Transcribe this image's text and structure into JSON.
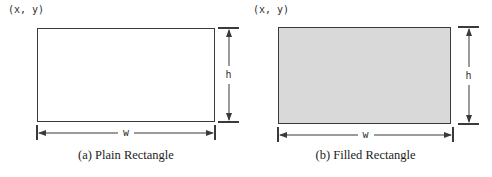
{
  "figures": [
    {
      "corner_label": "(x, y)",
      "height_label": "h",
      "width_label": "w",
      "caption": "(a) Plain Rectangle",
      "style": "plain",
      "fill_color": "#ffffff"
    },
    {
      "corner_label": "(x, y)",
      "height_label": "h",
      "width_label": "w",
      "caption": "(b) Filled Rectangle",
      "style": "filled",
      "fill_color": "#d9d9d9"
    }
  ],
  "colors": {
    "line": "#3a3a3a",
    "background": "#ffffff",
    "filled_rect_fill": "#d9d9d9"
  }
}
